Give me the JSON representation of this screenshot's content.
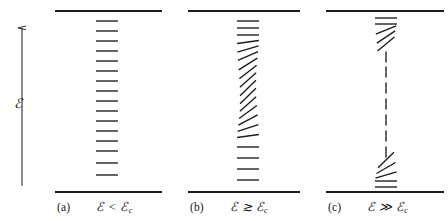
{
  "figure": {
    "kind": "energy-level-diagram",
    "background_color": "#ffffff",
    "ink_color": "#1b1b1b",
    "axis": {
      "label": "ℰ",
      "label_name": "script-e-energy",
      "arrow_direction": "up",
      "x": 22,
      "y_top": 28,
      "y_bottom": 186,
      "label_x": 14,
      "label_y": 95
    },
    "panels": [
      {
        "id": "a",
        "index_label": "(a)",
        "expression": "ℰ < ℰ",
        "expression_subscript": "c",
        "regime": "below-critical",
        "x_left": 55,
        "x_right": 162,
        "top_rule_y": 11,
        "bottom_rule_y": 192,
        "levels_x_center": 107,
        "level_half_width": 11,
        "level_tilt_deg": 0,
        "level_count": 16,
        "level_y_positions": [
          21,
          31,
          41,
          51,
          61,
          71,
          81,
          91,
          101,
          111,
          121,
          131,
          141,
          151,
          163,
          175
        ],
        "level_tilts": [
          0,
          0,
          0,
          0,
          0,
          0,
          0,
          0,
          0,
          0,
          0,
          0,
          0,
          0,
          0,
          0
        ]
      },
      {
        "id": "b",
        "index_label": "(b)",
        "expression": "ℰ ≳ ℰ",
        "expression_subscript": "c",
        "regime": "near-critical",
        "x_left": 188,
        "x_right": 300,
        "top_rule_y": 11,
        "bottom_rule_y": 192,
        "levels_x_center": 248,
        "level_half_width": 11,
        "level_count": 20,
        "level_y_positions": [
          21,
          28,
          35,
          42,
          49,
          56,
          64,
          72,
          80,
          88,
          96,
          104,
          112,
          120,
          128,
          136,
          147,
          158,
          169,
          180
        ],
        "level_tilts": [
          0,
          0,
          0,
          8,
          16,
          24,
          32,
          38,
          42,
          44,
          44,
          42,
          36,
          28,
          18,
          8,
          0,
          0,
          0,
          0
        ]
      },
      {
        "id": "c",
        "index_label": "(c)",
        "expression": "ℰ ≫ ℰ",
        "expression_subscript": "c",
        "regime": "far-above-critical",
        "x_left": 326,
        "x_right": 444,
        "top_rule_y": 11,
        "bottom_rule_y": 192,
        "levels_x_center": 386,
        "level_half_width": 11,
        "top_cluster_count": 5,
        "bottom_cluster_count": 5,
        "middle_dash_count": 7,
        "top_cluster_y": [
          18,
          24,
          30,
          37,
          44
        ],
        "top_cluster_tilts": [
          0,
          0,
          22,
          34,
          40
        ],
        "middle_dash_y": [
          57,
          72,
          88,
          104,
          120,
          136,
          152
        ],
        "bottom_cluster_y": [
          160,
          168,
          175,
          181,
          187
        ],
        "bottom_cluster_tilts": [
          44,
          30,
          16,
          0,
          0
        ]
      }
    ]
  }
}
